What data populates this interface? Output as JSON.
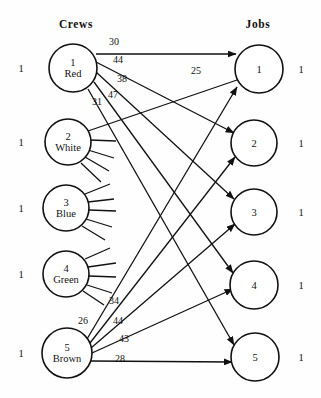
{
  "diagram": {
    "title_left": "Crews",
    "title_right": "Jobs",
    "type": "bipartite-assignment-network"
  },
  "headers": {
    "left": {
      "label": "Crews",
      "x": 76,
      "y": 24
    },
    "right": {
      "label": "Jobs",
      "x": 258,
      "y": 24
    }
  },
  "crews": [
    {
      "id": "1",
      "name": "Red",
      "cx": 73,
      "cy": 68,
      "r": 24,
      "supply": "1",
      "supply_x": 21,
      "supply_y": 68
    },
    {
      "id": "2",
      "name": "White",
      "cx": 68,
      "cy": 142,
      "r": 23,
      "supply": "1",
      "supply_x": 21,
      "supply_y": 142
    },
    {
      "id": "3",
      "name": "Blue",
      "cx": 66,
      "cy": 208,
      "r": 23,
      "supply": "1",
      "supply_x": 21,
      "supply_y": 208
    },
    {
      "id": "4",
      "name": "Green",
      "cx": 66,
      "cy": 274,
      "r": 23,
      "supply": "1",
      "supply_x": 21,
      "supply_y": 274
    },
    {
      "id": "5",
      "name": "Brown",
      "cx": 67,
      "cy": 353,
      "r": 25,
      "supply": "1",
      "supply_x": 21,
      "supply_y": 353
    }
  ],
  "jobs": [
    {
      "id": "1",
      "cx": 259,
      "cy": 69,
      "r": 24,
      "demand": "1",
      "demand_x": 301,
      "demand_y": 69
    },
    {
      "id": "2",
      "cx": 254,
      "cy": 143,
      "r": 23,
      "demand": "1",
      "demand_x": 301,
      "demand_y": 143
    },
    {
      "id": "3",
      "cx": 254,
      "cy": 212,
      "r": 23,
      "demand": "1",
      "demand_x": 301,
      "demand_y": 212
    },
    {
      "id": "4",
      "cx": 254,
      "cy": 285,
      "r": 24,
      "demand": "1",
      "demand_x": 301,
      "demand_y": 285
    },
    {
      "id": "5",
      "cx": 255,
      "cy": 357,
      "r": 24,
      "demand": "1",
      "demand_x": 301,
      "demand_y": 357
    }
  ],
  "edges": [
    {
      "from": "Red",
      "to": "1",
      "cost": "30",
      "lx": 114,
      "ly": 41,
      "x1": 96,
      "y1": 54,
      "x2": 236,
      "y2": 54
    },
    {
      "from": "Red",
      "to": "2",
      "cost": "44",
      "lx": 118,
      "ly": 59,
      "x1": 96,
      "y1": 62,
      "x2": 234,
      "y2": 133
    },
    {
      "from": "Red",
      "to": "3",
      "cost": "38",
      "lx": 122,
      "ly": 78,
      "x1": 96,
      "y1": 72,
      "x2": 234,
      "y2": 199
    },
    {
      "from": "Red",
      "to": "4",
      "cost": "47",
      "lx": 113,
      "ly": 94,
      "x1": 94,
      "y1": 82,
      "x2": 233,
      "y2": 273
    },
    {
      "from": "Red",
      "to": "5",
      "cost": "31",
      "lx": 97,
      "ly": 101,
      "x1": 88,
      "y1": 89,
      "x2": 234,
      "y2": 345
    },
    {
      "from": "White",
      "to": "1",
      "cost": "",
      "lx": 0,
      "ly": 0,
      "x1": 88,
      "y1": 131,
      "x2": 237,
      "y2": 80
    },
    {
      "from": "White",
      "to": "2",
      "cost": "",
      "lx": 0,
      "ly": 0,
      "x1": 90,
      "y1": 140,
      "x2": 116,
      "y2": 141
    },
    {
      "from": "White",
      "to": "3",
      "cost": "",
      "lx": 0,
      "ly": 0,
      "x1": 88,
      "y1": 150,
      "x2": 114,
      "y2": 158
    },
    {
      "from": "White",
      "to": "4",
      "cost": "",
      "lx": 0,
      "ly": 0,
      "x1": 85,
      "y1": 157,
      "x2": 109,
      "y2": 171
    },
    {
      "from": "White",
      "to": "5",
      "cost": "",
      "lx": 0,
      "ly": 0,
      "x1": 81,
      "y1": 163,
      "x2": 101,
      "y2": 182
    },
    {
      "from": "Blue",
      "to": "1",
      "cost": "",
      "lx": 0,
      "ly": 0,
      "x1": 85,
      "y1": 194,
      "x2": 110,
      "y2": 184
    },
    {
      "from": "Blue",
      "to": "2",
      "cost": "",
      "lx": 0,
      "ly": 0,
      "x1": 88,
      "y1": 202,
      "x2": 114,
      "y2": 199
    },
    {
      "from": "Blue",
      "to": "3",
      "cost": "",
      "lx": 0,
      "ly": 0,
      "x1": 89,
      "y1": 210,
      "x2": 116,
      "y2": 211
    },
    {
      "from": "Blue",
      "to": "4",
      "cost": "",
      "lx": 0,
      "ly": 0,
      "x1": 86,
      "y1": 219,
      "x2": 112,
      "y2": 227
    },
    {
      "from": "Blue",
      "to": "5",
      "cost": "",
      "lx": 0,
      "ly": 0,
      "x1": 82,
      "y1": 226,
      "x2": 105,
      "y2": 240
    },
    {
      "from": "Green",
      "to": "1",
      "cost": "",
      "lx": 0,
      "ly": 0,
      "x1": 85,
      "y1": 259,
      "x2": 110,
      "y2": 248
    },
    {
      "from": "Green",
      "to": "2",
      "cost": "",
      "lx": 0,
      "ly": 0,
      "x1": 88,
      "y1": 267,
      "x2": 116,
      "y2": 263
    },
    {
      "from": "Green",
      "to": "3",
      "cost": "",
      "lx": 0,
      "ly": 0,
      "x1": 89,
      "y1": 276,
      "x2": 116,
      "y2": 277
    },
    {
      "from": "Green",
      "to": "4",
      "cost": "",
      "lx": 0,
      "ly": 0,
      "x1": 87,
      "y1": 285,
      "x2": 112,
      "y2": 293
    },
    {
      "from": "Green",
      "to": "5",
      "cost": "",
      "lx": 0,
      "ly": 0,
      "x1": 83,
      "y1": 291,
      "x2": 104,
      "y2": 305
    },
    {
      "from": "Brown",
      "to": "1",
      "cost": "26",
      "lx": 83,
      "ly": 320,
      "x1": 87,
      "y1": 339,
      "x2": 237,
      "y2": 87
    },
    {
      "from": "Brown",
      "to": "2",
      "cost": "34",
      "lx": 114,
      "ly": 300,
      "x1": 90,
      "y1": 343,
      "x2": 235,
      "y2": 157
    },
    {
      "from": "Brown",
      "to": "3",
      "cost": "44",
      "lx": 118,
      "ly": 320,
      "x1": 91,
      "y1": 348,
      "x2": 235,
      "y2": 224
    },
    {
      "from": "Brown",
      "to": "4",
      "cost": "43",
      "lx": 124,
      "ly": 338,
      "x1": 92,
      "y1": 353,
      "x2": 233,
      "y2": 289
    },
    {
      "from": "Brown",
      "to": "5",
      "cost": "28",
      "lx": 120,
      "ly": 358,
      "x1": 91,
      "y1": 361,
      "x2": 232,
      "y2": 362
    }
  ],
  "crossing_edges": [
    {
      "cost": "25",
      "lx": 196,
      "ly": 70
    }
  ],
  "colors": {
    "stroke": "#111111",
    "background": "#fefefe",
    "node_fill": "#ffffff"
  }
}
